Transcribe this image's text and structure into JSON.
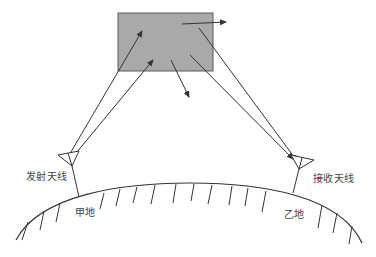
{
  "diagram": {
    "type": "tropospheric-scatter-communication",
    "scatter_region": {
      "shape": "rectangle",
      "fill_color": "#a8a8a8",
      "stroke_color": "#555555"
    },
    "labels": {
      "transmit_antenna": "发射天线",
      "receive_antenna": "接收天线",
      "site_a": "甲地",
      "site_b": "乙地"
    },
    "colors": {
      "line": "#333333",
      "text": "#444444",
      "background": "#ffffff"
    }
  }
}
